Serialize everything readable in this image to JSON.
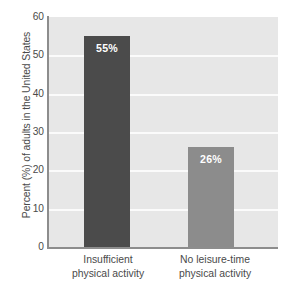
{
  "chart_data": {
    "type": "bar",
    "title": "",
    "subtitle": "",
    "xlabel": "",
    "ylabel": "Percent (%) of adults in the United States",
    "ylim": [
      0,
      60
    ],
    "ytick_labels": [
      "60",
      "50",
      "40",
      "30",
      "20",
      "10",
      "0"
    ],
    "ytick_values": [
      60,
      50,
      40,
      30,
      20,
      10,
      0
    ],
    "grid": true,
    "legend": "none",
    "categories": [
      "Insufficient physical activity",
      "No leisure-time physical activity"
    ],
    "category_lines": [
      [
        "Insufficient",
        "physical activity"
      ],
      [
        "No leisure-time",
        "physical activity"
      ]
    ],
    "values": [
      55,
      26
    ],
    "data_labels": [
      "55%",
      "26%"
    ],
    "bar_colors": [
      "#4b4b4b",
      "#8c8c8c"
    ],
    "plot_background": "#e7e7e7",
    "gridline_color": "#fbfbfb",
    "axis_color": "#8d8d8d",
    "text_color": "#4a4a4a",
    "data_label_color": "#ffffff"
  }
}
